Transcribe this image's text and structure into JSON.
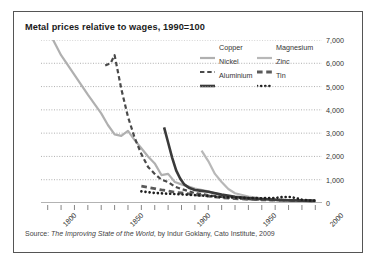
{
  "chart_data": {
    "type": "line",
    "title": "Metal prices relative to wages, 1990=100",
    "xlabel": "",
    "ylabel": "",
    "xlim": [
      1795,
      2005
    ],
    "ylim": [
      0,
      7000
    ],
    "grid": true,
    "legend_position": "top-right",
    "x_ticks": [
      "1800",
      "1850",
      "1900",
      "1950",
      "2000"
    ],
    "x_tick_values": [
      1800,
      1850,
      1900,
      1950,
      2000
    ],
    "x_minor_tick_step": 10,
    "y_ticks": [
      "0",
      "1,000",
      "2,000",
      "3,000",
      "4,000",
      "5,000",
      "6,000",
      "7,000"
    ],
    "y_tick_values": [
      0,
      1000,
      2000,
      3000,
      4000,
      5000,
      6000,
      7000
    ],
    "series": [
      {
        "name": "Copper",
        "color": "#b0b0b0",
        "style": "solid",
        "width": 2.2,
        "points": [
          [
            1800,
            7450
          ],
          [
            1810,
            6350
          ],
          [
            1820,
            5500
          ],
          [
            1830,
            4650
          ],
          [
            1840,
            3850
          ],
          [
            1845,
            3350
          ],
          [
            1850,
            2950
          ],
          [
            1855,
            2880
          ],
          [
            1860,
            3100
          ],
          [
            1865,
            2700
          ],
          [
            1870,
            2350
          ],
          [
            1875,
            2000
          ],
          [
            1880,
            1700
          ],
          [
            1885,
            1200
          ],
          [
            1890,
            1250
          ],
          [
            1895,
            900
          ],
          [
            1900,
            800
          ],
          [
            1910,
            620
          ],
          [
            1920,
            500
          ],
          [
            1930,
            330
          ],
          [
            1940,
            250
          ],
          [
            1950,
            180
          ],
          [
            1960,
            150
          ],
          [
            1970,
            130
          ],
          [
            1980,
            110
          ],
          [
            1990,
            100
          ],
          [
            2000,
            90
          ]
        ]
      },
      {
        "name": "Magnesium",
        "color": "#b8b8b8",
        "style": "solid",
        "width": 2.2,
        "points": [
          [
            1915,
            2250
          ],
          [
            1920,
            1800
          ],
          [
            1925,
            1250
          ],
          [
            1930,
            900
          ],
          [
            1935,
            600
          ],
          [
            1940,
            420
          ],
          [
            1950,
            280
          ],
          [
            1960,
            200
          ],
          [
            1970,
            150
          ],
          [
            1980,
            120
          ],
          [
            1990,
            100
          ],
          [
            2000,
            92
          ]
        ]
      },
      {
        "name": "Nickel",
        "color": "#4a4a4a",
        "style": "dashed",
        "width": 2.2,
        "points": [
          [
            1843,
            5900
          ],
          [
            1847,
            6000
          ],
          [
            1850,
            6350
          ],
          [
            1855,
            4900
          ],
          [
            1860,
            3700
          ],
          [
            1865,
            2800
          ],
          [
            1870,
            2100
          ],
          [
            1875,
            1550
          ],
          [
            1880,
            1250
          ],
          [
            1885,
            1000
          ],
          [
            1890,
            900
          ],
          [
            1895,
            700
          ],
          [
            1900,
            600
          ],
          [
            1910,
            430
          ],
          [
            1920,
            340
          ],
          [
            1930,
            260
          ],
          [
            1940,
            200
          ],
          [
            1950,
            160
          ],
          [
            1960,
            135
          ],
          [
            1970,
            120
          ],
          [
            1980,
            108
          ],
          [
            1990,
            100
          ],
          [
            2000,
            95
          ]
        ]
      },
      {
        "name": "Zinc",
        "color": "#5a5a5a",
        "style": "dashed",
        "width": 2.8,
        "points": [
          [
            1870,
            720
          ],
          [
            1875,
            670
          ],
          [
            1880,
            620
          ],
          [
            1885,
            560
          ],
          [
            1890,
            520
          ],
          [
            1895,
            460
          ],
          [
            1900,
            430
          ],
          [
            1910,
            360
          ],
          [
            1920,
            300
          ],
          [
            1930,
            230
          ],
          [
            1940,
            190
          ],
          [
            1950,
            160
          ],
          [
            1960,
            140
          ],
          [
            1970,
            125
          ],
          [
            1980,
            112
          ],
          [
            1990,
            100
          ],
          [
            2000,
            95
          ]
        ]
      },
      {
        "name": "Aluminium",
        "color": "#3a3a3a",
        "style": "solid",
        "width": 2.6,
        "points": [
          [
            1887,
            3250
          ],
          [
            1890,
            2600
          ],
          [
            1893,
            1950
          ],
          [
            1896,
            1400
          ],
          [
            1899,
            1050
          ],
          [
            1902,
            800
          ],
          [
            1906,
            640
          ],
          [
            1910,
            560
          ],
          [
            1915,
            520
          ],
          [
            1920,
            480
          ],
          [
            1930,
            360
          ],
          [
            1940,
            270
          ],
          [
            1950,
            210
          ],
          [
            1960,
            170
          ],
          [
            1970,
            140
          ],
          [
            1980,
            115
          ],
          [
            1990,
            100
          ],
          [
            2000,
            92
          ]
        ]
      },
      {
        "name": "Tin",
        "color": "#1f1f1f",
        "style": "dotted",
        "width": 2.6,
        "points": [
          [
            1870,
            500
          ],
          [
            1880,
            430
          ],
          [
            1890,
            400
          ],
          [
            1900,
            370
          ],
          [
            1910,
            340
          ],
          [
            1920,
            300
          ],
          [
            1930,
            250
          ],
          [
            1940,
            230
          ],
          [
            1950,
            215
          ],
          [
            1960,
            205
          ],
          [
            1970,
            215
          ],
          [
            1975,
            255
          ],
          [
            1980,
            265
          ],
          [
            1985,
            220
          ],
          [
            1990,
            140
          ],
          [
            1995,
            110
          ],
          [
            2000,
            100
          ]
        ]
      }
    ]
  },
  "legend": {
    "entries": [
      {
        "label": "Copper",
        "series": "Copper"
      },
      {
        "label": "Nickel",
        "series": "Nickel"
      },
      {
        "label": "Aluminium",
        "series": "Aluminium"
      },
      {
        "label": "Magnesium",
        "series": "Magnesium"
      },
      {
        "label": "Zinc",
        "series": "Zinc"
      },
      {
        "label": "Tin",
        "series": "Tin"
      }
    ]
  },
  "source": {
    "prefix": "Source: ",
    "italic_title": "The Improving State of the World",
    "suffix": ", by Indur Goklany, Cato Institute, 2009"
  }
}
